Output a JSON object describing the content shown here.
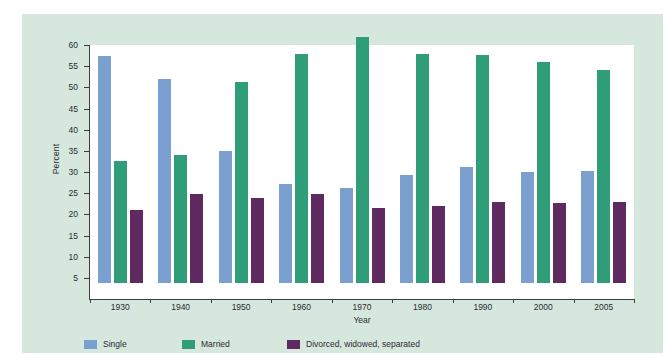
{
  "chart_data": {
    "type": "bar",
    "title": "",
    "xlabel": "Year",
    "ylabel": "Percent",
    "ylim": [
      0,
      60
    ],
    "yticks": [
      5,
      10,
      15,
      20,
      25,
      30,
      35,
      40,
      45,
      50,
      55,
      60
    ],
    "grid": false,
    "legend_position": "bottom-left",
    "categories": [
      "1930",
      "1940",
      "1950",
      "1960",
      "1970",
      "1980",
      "1990",
      "2000",
      "2005"
    ],
    "series": [
      {
        "name": "Single",
        "color": "#7ba0d0",
        "values": [
          53.7,
          48.2,
          31.2,
          23.5,
          22.4,
          25.6,
          27.3,
          26.2,
          26.4
        ]
      },
      {
        "name": "Married",
        "color": "#2f9e78",
        "values": [
          28.9,
          30.2,
          47.5,
          54.0,
          58.0,
          54.0,
          53.8,
          52.2,
          50.4
        ]
      },
      {
        "name": "Divorced, widowed, separated",
        "color": "#5e2a60",
        "values": [
          17.3,
          21.0,
          20.1,
          21.0,
          17.7,
          18.2,
          19.2,
          19.0,
          19.1
        ]
      }
    ]
  },
  "colors": {
    "panel_background": "#d6e8dd",
    "plot_background": "#ffffff",
    "axis": "#3c3c46",
    "text": "#2a2a33"
  }
}
